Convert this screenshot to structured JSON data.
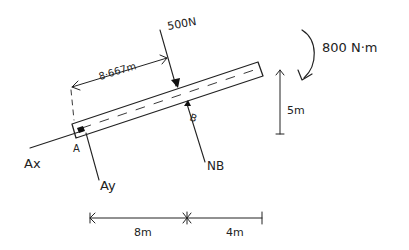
{
  "diagram": {
    "type": "free-body-diagram",
    "colors": {
      "ink": "#222222",
      "background": "#ffffff"
    },
    "beam": {
      "left_support": "A",
      "right_support": "B"
    },
    "labels": {
      "force_500": "500N",
      "moment": "800 N·m",
      "dim_8667": "8·667m",
      "height_5": "5m",
      "point_a": "A",
      "point_b": "B",
      "ax": "Ax",
      "ay": "Ay",
      "nb": "NB",
      "dim_8": "8m",
      "dim_4": "4m"
    },
    "dimensions": [
      {
        "label": "8·667m",
        "between": "A to 500N"
      },
      {
        "label": "5m",
        "direction": "vertical"
      },
      {
        "label": "8m",
        "direction": "horizontal"
      },
      {
        "label": "4m",
        "direction": "horizontal"
      }
    ],
    "forces": [
      {
        "name": "500N",
        "direction": "down"
      },
      {
        "name": "800 N·m",
        "type": "moment",
        "sense": "clockwise"
      },
      {
        "name": "Ax",
        "at": "A"
      },
      {
        "name": "Ay",
        "at": "A"
      },
      {
        "name": "NB",
        "at": "B"
      }
    ]
  }
}
